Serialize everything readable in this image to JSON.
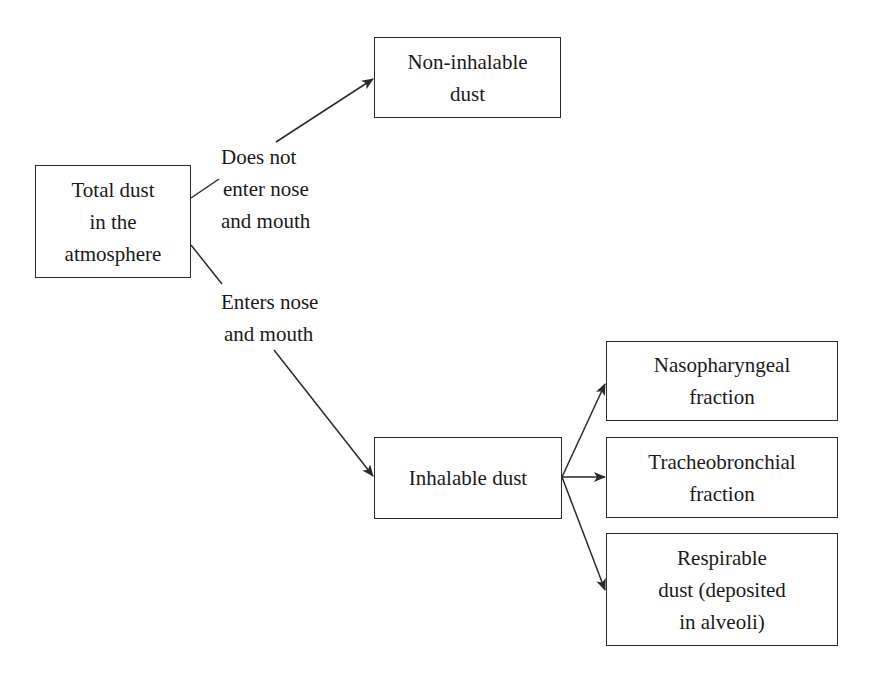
{
  "diagram": {
    "type": "flowchart",
    "colors": {
      "stroke": "#2a2a2a",
      "text": "#1a1a1a",
      "background": "#ffffff"
    },
    "nodes": {
      "total": {
        "lines": [
          "Total dust",
          "in the",
          "atmosphere"
        ]
      },
      "non_inhalable": {
        "lines": [
          "Non-inhalable",
          "dust"
        ]
      },
      "inhalable": {
        "lines": [
          "Inhalable dust"
        ]
      },
      "nasopharyngeal": {
        "lines": [
          "Nasopharyngeal",
          "fraction"
        ]
      },
      "tracheobronchial": {
        "lines": [
          "Tracheobronchial",
          "fraction"
        ]
      },
      "respirable": {
        "lines": [
          "Respirable",
          "dust (deposited",
          "in alveoli)"
        ]
      }
    },
    "edge_labels": {
      "does_not_enter": {
        "lines": [
          "Does not",
          "enter nose",
          "and mouth"
        ]
      },
      "enters": {
        "lines": [
          "Enters nose",
          "and mouth"
        ]
      }
    },
    "edges": [
      {
        "from": "total",
        "to": "non_inhalable",
        "label": "does_not_enter"
      },
      {
        "from": "total",
        "to": "inhalable",
        "label": "enters"
      },
      {
        "from": "inhalable",
        "to": "nasopharyngeal"
      },
      {
        "from": "inhalable",
        "to": "tracheobronchial"
      },
      {
        "from": "inhalable",
        "to": "respirable"
      }
    ]
  }
}
